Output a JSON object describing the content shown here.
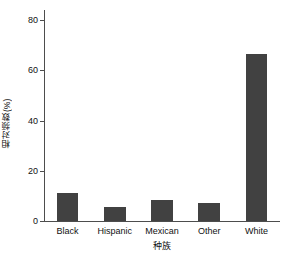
{
  "chart_data": {
    "type": "bar",
    "title": "",
    "subtitle": "",
    "xlabel": "种族",
    "ylabel": "相对频数(%)",
    "categories": [
      "Black",
      "Hispanic",
      "Mexican",
      "Other",
      "White"
    ],
    "values": [
      11.0,
      5.5,
      8.5,
      7.0,
      66.5
    ],
    "ylim": [
      0,
      84
    ],
    "yticks": [
      0,
      20,
      40,
      60,
      80
    ],
    "ytick_labels": [
      "0",
      "20",
      "40",
      "60",
      "80"
    ],
    "xlim": [
      0,
      5
    ],
    "grid": false,
    "legend": null,
    "bar_color": "#414141",
    "axis_color": "#4d4d4d",
    "background": "#ffffff",
    "annotations": []
  },
  "figure": {
    "caption": ""
  }
}
